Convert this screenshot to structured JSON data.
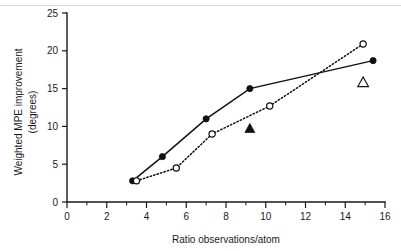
{
  "chart_data": {
    "type": "scatter",
    "title": "",
    "subtitle": "",
    "xlabel": "Ratio observations/atom",
    "ylabel": "Weighted MPE improvement (degrees)",
    "ylabel_line1": "Weighted MPE improvement",
    "ylabel_line2": "(degrees)",
    "xlim": [
      0,
      16
    ],
    "ylim": [
      0,
      25
    ],
    "x_ticks": [
      0,
      2,
      4,
      6,
      8,
      10,
      12,
      14,
      16
    ],
    "x_tick_labels": [
      "0",
      "2",
      "4",
      "6",
      "8",
      "10",
      "12",
      "14",
      "16"
    ],
    "x_minor_step": 1,
    "y_ticks": [
      0,
      5,
      10,
      15,
      20,
      25
    ],
    "y_tick_labels": [
      "0",
      "5",
      "10",
      "15",
      "20",
      "25"
    ],
    "grid": false,
    "legend_position": "none",
    "series": [
      {
        "name": "solid-line-filled-circles",
        "marker": "filled-circle",
        "line": "solid",
        "color": "#111111",
        "points": [
          {
            "x": 3.3,
            "y": 2.8
          },
          {
            "x": 4.8,
            "y": 6.0
          },
          {
            "x": 7.0,
            "y": 11.0
          },
          {
            "x": 9.2,
            "y": 15.0
          },
          {
            "x": 15.4,
            "y": 18.7
          }
        ]
      },
      {
        "name": "dotted-line-open-circles",
        "marker": "open-circle",
        "line": "dotted",
        "color": "#111111",
        "points": [
          {
            "x": 3.5,
            "y": 2.8
          },
          {
            "x": 5.5,
            "y": 4.5
          },
          {
            "x": 7.3,
            "y": 9.0
          },
          {
            "x": 10.2,
            "y": 12.7
          },
          {
            "x": 14.9,
            "y": 20.9
          }
        ]
      },
      {
        "name": "filled-triangle-single-point",
        "marker": "filled-triangle",
        "line": "none",
        "color": "#111111",
        "points": [
          {
            "x": 9.2,
            "y": 9.7
          }
        ]
      },
      {
        "name": "open-triangle-single-point",
        "marker": "open-triangle",
        "line": "none",
        "color": "#111111",
        "points": [
          {
            "x": 14.9,
            "y": 15.8
          }
        ]
      }
    ]
  },
  "figure": {
    "background_color": "#ffffff",
    "ink_color": "#111111"
  }
}
